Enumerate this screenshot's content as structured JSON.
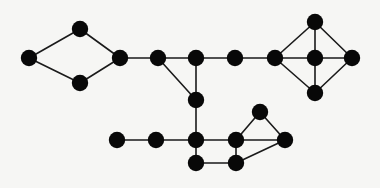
{
  "figure": {
    "background_color": "#f6f6f4",
    "node_color": "#080808",
    "edge_color": "#1a1a1a",
    "node_radius": 8.2,
    "edge_width": 1.6,
    "width": 380,
    "height": 188
  },
  "graph": {
    "type": "undirected-node-link",
    "node_count": 21,
    "edge_count": 28,
    "nodes": [
      {
        "id": "n1",
        "label": "",
        "x": 29,
        "y": 58,
        "group": "left-diamond"
      },
      {
        "id": "n2",
        "label": "",
        "x": 80,
        "y": 29,
        "group": "left-diamond"
      },
      {
        "id": "n3",
        "label": "",
        "x": 80,
        "y": 83,
        "group": "left-diamond"
      },
      {
        "id": "n4",
        "label": "",
        "x": 120,
        "y": 58,
        "group": "left-diamond"
      },
      {
        "id": "n5",
        "label": "",
        "x": 158,
        "y": 58,
        "group": "top-path"
      },
      {
        "id": "n6",
        "label": "",
        "x": 196,
        "y": 58,
        "group": "top-path"
      },
      {
        "id": "n7",
        "label": "",
        "x": 235,
        "y": 58,
        "group": "top-path"
      },
      {
        "id": "n8",
        "label": "",
        "x": 275,
        "y": 58,
        "group": "right-wheel"
      },
      {
        "id": "n9",
        "label": "",
        "x": 315,
        "y": 22,
        "group": "right-wheel"
      },
      {
        "id": "n10",
        "label": "",
        "x": 315,
        "y": 58,
        "group": "right-wheel"
      },
      {
        "id": "n11",
        "label": "",
        "x": 315,
        "y": 93,
        "group": "right-wheel"
      },
      {
        "id": "n12",
        "label": "",
        "x": 352,
        "y": 58,
        "group": "right-wheel"
      },
      {
        "id": "n13",
        "label": "",
        "x": 196,
        "y": 100,
        "group": "center-stem"
      },
      {
        "id": "n14",
        "label": "",
        "x": 117,
        "y": 140,
        "group": "bottom-path"
      },
      {
        "id": "n15",
        "label": "",
        "x": 156,
        "y": 140,
        "group": "bottom-path"
      },
      {
        "id": "n16",
        "label": "",
        "x": 196,
        "y": 140,
        "group": "bottom-square"
      },
      {
        "id": "n17",
        "label": "",
        "x": 196,
        "y": 163,
        "group": "bottom-square"
      },
      {
        "id": "n18",
        "label": "",
        "x": 236,
        "y": 163,
        "group": "bottom-square"
      },
      {
        "id": "n19",
        "label": "",
        "x": 236,
        "y": 140,
        "group": "bottom-right-cluster"
      },
      {
        "id": "n20",
        "label": "",
        "x": 260,
        "y": 112,
        "group": "bottom-right-cluster"
      },
      {
        "id": "n21",
        "label": "",
        "x": 285,
        "y": 140,
        "group": "bottom-right-cluster"
      }
    ],
    "edges": [
      {
        "source": "n1",
        "target": "n2"
      },
      {
        "source": "n1",
        "target": "n3"
      },
      {
        "source": "n2",
        "target": "n4"
      },
      {
        "source": "n3",
        "target": "n4"
      },
      {
        "source": "n4",
        "target": "n5"
      },
      {
        "source": "n5",
        "target": "n6"
      },
      {
        "source": "n5",
        "target": "n13"
      },
      {
        "source": "n6",
        "target": "n7"
      },
      {
        "source": "n6",
        "target": "n13"
      },
      {
        "source": "n7",
        "target": "n8"
      },
      {
        "source": "n8",
        "target": "n9"
      },
      {
        "source": "n8",
        "target": "n10"
      },
      {
        "source": "n8",
        "target": "n11"
      },
      {
        "source": "n9",
        "target": "n10"
      },
      {
        "source": "n9",
        "target": "n12"
      },
      {
        "source": "n10",
        "target": "n11"
      },
      {
        "source": "n10",
        "target": "n12"
      },
      {
        "source": "n11",
        "target": "n12"
      },
      {
        "source": "n13",
        "target": "n16"
      },
      {
        "source": "n14",
        "target": "n15"
      },
      {
        "source": "n15",
        "target": "n16"
      },
      {
        "source": "n16",
        "target": "n17"
      },
      {
        "source": "n16",
        "target": "n19"
      },
      {
        "source": "n17",
        "target": "n18"
      },
      {
        "source": "n18",
        "target": "n19"
      },
      {
        "source": "n18",
        "target": "n21"
      },
      {
        "source": "n19",
        "target": "n20"
      },
      {
        "source": "n19",
        "target": "n21"
      },
      {
        "source": "n20",
        "target": "n21"
      }
    ]
  }
}
